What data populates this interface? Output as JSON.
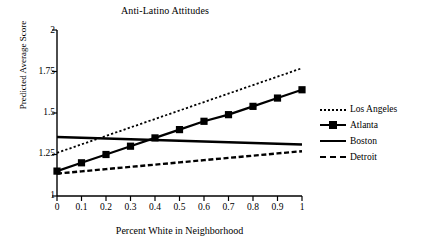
{
  "chart_data": {
    "type": "line",
    "title": "Anti-Latino Attitudes",
    "xlabel": "Percent White in Neighborhood",
    "ylabel": "Predicted Average Score",
    "x": [
      0,
      0.1,
      0.2,
      0.3,
      0.4,
      0.5,
      0.6,
      0.7,
      0.8,
      0.9,
      1
    ],
    "xticklabels": [
      "0",
      "0.1",
      "0.2",
      "0.3",
      "0.4",
      "0.5",
      "0.6",
      "0.7",
      "0.8",
      "0.9",
      "1"
    ],
    "yticklabels": [
      "1",
      "1.25",
      "1.5",
      "1.75",
      "2"
    ],
    "yticks": [
      1,
      1.25,
      1.5,
      1.75,
      2
    ],
    "xlim": [
      0,
      1
    ],
    "ylim": [
      1,
      2
    ],
    "grid": false,
    "legend_position": "right",
    "series": [
      {
        "name": "Los Angeles",
        "style": "dotted",
        "marker": "none",
        "color": "#000000",
        "values": [
          1.26,
          1.311,
          1.362,
          1.413,
          1.464,
          1.515,
          1.566,
          1.617,
          1.668,
          1.719,
          1.77
        ]
      },
      {
        "name": "Atlanta",
        "style": "solid",
        "marker": "square",
        "color": "#000000",
        "values": [
          1.15,
          1.2,
          1.25,
          1.3,
          1.35,
          1.4,
          1.45,
          1.49,
          1.54,
          1.59,
          1.64
        ]
      },
      {
        "name": "Boston",
        "style": "solid",
        "marker": "none",
        "color": "#000000",
        "values": [
          1.355,
          1.3505,
          1.346,
          1.3415,
          1.337,
          1.3325,
          1.328,
          1.3235,
          1.319,
          1.3145,
          1.31
        ]
      },
      {
        "name": "Detroit",
        "style": "dashed",
        "marker": "none",
        "color": "#000000",
        "values": [
          1.135,
          1.1485,
          1.162,
          1.1755,
          1.189,
          1.2025,
          1.216,
          1.2295,
          1.243,
          1.2565,
          1.27
        ]
      }
    ]
  },
  "legend": {
    "items": [
      {
        "label": "Los Angeles"
      },
      {
        "label": "Atlanta"
      },
      {
        "label": "Boston"
      },
      {
        "label": "Detroit"
      }
    ]
  }
}
